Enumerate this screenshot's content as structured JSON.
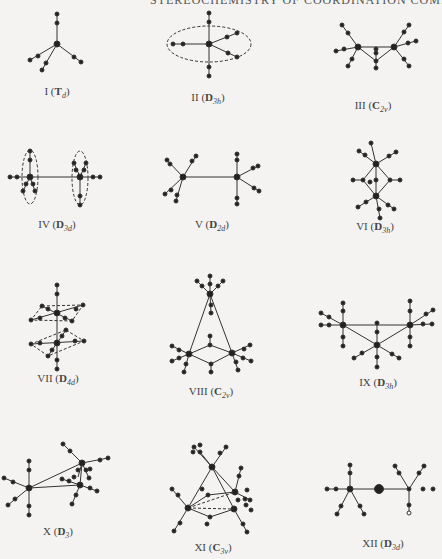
{
  "header": {
    "text": "STEREOCHEMISTRY OF COORDINATION COMPOUNDS"
  },
  "structures": [
    {
      "numeral": "I",
      "group": "T",
      "sub": "d",
      "x": 57,
      "y": 93
    },
    {
      "numeral": "II",
      "group": "D",
      "sub": "3h",
      "x": 208,
      "y": 99
    },
    {
      "numeral": "III",
      "group": "C",
      "sub": "2v",
      "x": 373,
      "y": 107
    },
    {
      "numeral": "IV",
      "group": "D",
      "sub": "3d",
      "x": 57,
      "y": 226
    },
    {
      "numeral": "V",
      "group": "D",
      "sub": "2d",
      "x": 212,
      "y": 226
    },
    {
      "numeral": "VI",
      "group": "D",
      "sub": "3h",
      "x": 375,
      "y": 226
    },
    {
      "numeral": "VII",
      "group": "D",
      "sub": "4d",
      "x": 58,
      "y": 373
    },
    {
      "numeral": "VIII",
      "group": "C",
      "sub": "2v",
      "x": 211,
      "y": 391
    },
    {
      "numeral": "IX",
      "group": "D",
      "sub": "3h",
      "x": 378,
      "y": 382
    },
    {
      "numeral": "X",
      "group": "D",
      "sub": "3",
      "x": 58,
      "y": 531
    },
    {
      "numeral": "XI",
      "group": "C",
      "sub": "3v",
      "x": 213,
      "y": 548
    },
    {
      "numeral": "XII",
      "group": "D",
      "sub": "3d",
      "x": 383,
      "y": 543
    }
  ]
}
